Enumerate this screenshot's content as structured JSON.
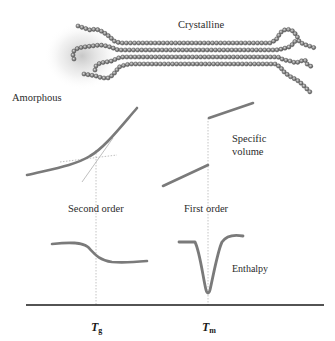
{
  "figure": {
    "labels": {
      "crystalline": "Crystalline",
      "amorphous": "Amorphous",
      "specific_volume_line1": "Specific",
      "specific_volume_line2": "volume",
      "second_order": "Second order",
      "first_order": "First order",
      "enthalpy": "Enthalpy",
      "tg_symbol": "T",
      "tg_subscript": "g",
      "tm_symbol": "T",
      "tm_subscript": "m"
    },
    "colors": {
      "curve": "#7a7a7a",
      "bead": "#8c8c8c",
      "bead_outline": "#4a4a4a",
      "guide": "#b5b5b5",
      "axis": "#1a1a1a",
      "text": "#2b2b2b"
    },
    "panels": [
      {
        "name": "specific-volume-second-order",
        "transition": "Tg",
        "shape": "smooth curve with change in slope (kink), tangent extrapolations meeting at Tg"
      },
      {
        "name": "specific-volume-first-order",
        "transition": "Tm",
        "shape": "discontinuous step jump at Tm"
      },
      {
        "name": "enthalpy-second-order",
        "transition": "Tg",
        "shape": "step-like drop at Tg"
      },
      {
        "name": "enthalpy-first-order",
        "transition": "Tm",
        "shape": "sharp endothermic peak (dip) at Tm"
      }
    ]
  }
}
